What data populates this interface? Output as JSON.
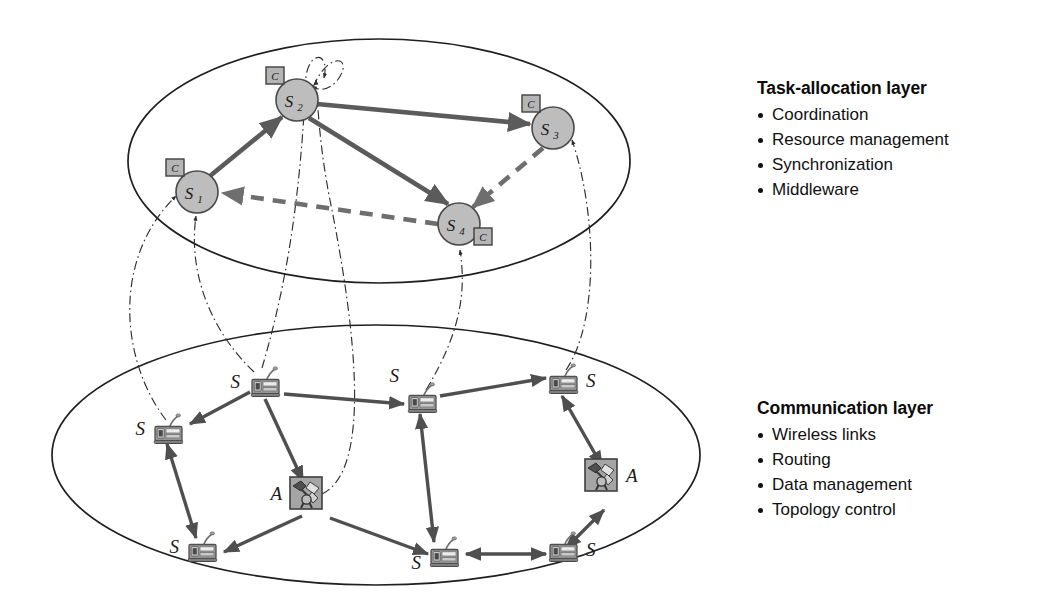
{
  "figure": {
    "kind": "layered-architecture-diagram",
    "background": "#ffffff"
  },
  "colors": {
    "node_fill": "#bdbdbd",
    "node_stroke": "#4a4a4a",
    "badge_fill": "#b5b5b5",
    "link_solid": "#5b5b5b",
    "link_dashed": "#6e6e6e",
    "cross_layer": "#2e2e2e",
    "ellipse_stroke": "#1f1f1f",
    "sensor_body": "#8c8c8c",
    "actuator_fill": "#9a9a9a",
    "text": "#111111"
  },
  "layers": {
    "task_allocation": {
      "panel_title": "Task-allocation layer",
      "bullets": [
        "Coordination",
        "Resource management",
        "Synchronization",
        "Middleware"
      ],
      "nodes": [
        {
          "id": "S1",
          "label": "S",
          "sub": "1",
          "badge": "C",
          "badge_pos": "top-left",
          "cx": 197,
          "cy": 192,
          "r": 21
        },
        {
          "id": "S2",
          "label": "S",
          "sub": "2",
          "badge": "C",
          "badge_pos": "top-left",
          "cx": 297,
          "cy": 100,
          "r": 21
        },
        {
          "id": "S3",
          "label": "S",
          "sub": "3",
          "badge": "C",
          "badge_pos": "top-left",
          "cx": 553,
          "cy": 128,
          "r": 21
        },
        {
          "id": "S4",
          "label": "S",
          "sub": "4",
          "badge": "C",
          "badge_pos": "bottom-right",
          "cx": 459,
          "cy": 224,
          "r": 21
        }
      ],
      "links": [
        {
          "from": "S1",
          "to": "S2",
          "style": "solid",
          "arrow": "end"
        },
        {
          "from": "S2",
          "to": "S3",
          "style": "solid",
          "arrow": "end"
        },
        {
          "from": "S2",
          "to": "S4",
          "style": "solid",
          "arrow": "end"
        },
        {
          "from": "S3",
          "to": "S4",
          "style": "dashed",
          "arrow": "end"
        },
        {
          "from": "S4",
          "to": "S1",
          "style": "dashed",
          "arrow": "end"
        },
        {
          "from": "S2",
          "to": "S2",
          "style": "selfloop-dashdot",
          "arrow": "end"
        }
      ]
    },
    "communication": {
      "panel_title": "Communication layer",
      "bullets": [
        "Wireless links",
        "Routing",
        "Data management",
        "Topology control"
      ],
      "nodes": [
        {
          "id": "n1",
          "type": "sensor",
          "label": "S",
          "label_side": "left",
          "x": 253,
          "y": 381
        },
        {
          "id": "n2",
          "type": "sensor",
          "label": "S",
          "label_side": "left",
          "x": 156,
          "y": 428
        },
        {
          "id": "n3",
          "type": "sensor",
          "label": "S",
          "label_side": "left",
          "x": 410,
          "y": 397
        },
        {
          "id": "n4",
          "type": "sensor",
          "label": "S",
          "label_side": "right",
          "x": 551,
          "y": 378
        },
        {
          "id": "n5",
          "type": "sensor",
          "label": "S",
          "label_side": "left",
          "x": 190,
          "y": 546
        },
        {
          "id": "n6",
          "type": "sensor",
          "label": "S",
          "label_side": "left",
          "x": 432,
          "y": 551
        },
        {
          "id": "n7",
          "type": "sensor",
          "label": "S",
          "label_side": "right",
          "x": 551,
          "y": 546
        },
        {
          "id": "a1",
          "type": "actuator",
          "label": "A",
          "label_side": "left",
          "x": 306,
          "y": 492
        },
        {
          "id": "a2",
          "type": "actuator",
          "label": "A",
          "label_side": "right",
          "x": 601,
          "y": 474
        }
      ],
      "links": [
        {
          "from": "n1",
          "to": "n2",
          "arrow": "end"
        },
        {
          "from": "n1",
          "to": "n3",
          "arrow": "end"
        },
        {
          "from": "n3",
          "to": "n4",
          "arrow": "end"
        },
        {
          "from": "n1",
          "to": "a1",
          "arrow": "end"
        },
        {
          "from": "n2",
          "to": "n5",
          "arrow": "both"
        },
        {
          "from": "n5",
          "to": "a1",
          "arrow": "end"
        },
        {
          "from": "a1",
          "to": "n6",
          "arrow": "end"
        },
        {
          "from": "n6",
          "to": "n3",
          "arrow": "end"
        },
        {
          "from": "n6",
          "to": "n7",
          "arrow": "both"
        },
        {
          "from": "n4",
          "to": "a2",
          "arrow": "both"
        },
        {
          "from": "a2",
          "to": "n7",
          "arrow": "both"
        }
      ]
    }
  },
  "cross_layer_links": [
    {
      "from": "n2",
      "to": "S1",
      "style": "dash-dot"
    },
    {
      "from": "n1",
      "to": "S1",
      "style": "dash-dot"
    },
    {
      "from": "n1",
      "to": "S2",
      "style": "dash-dot"
    },
    {
      "from": "a1",
      "to": "S2",
      "style": "dash-dot"
    },
    {
      "from": "n3",
      "to": "S4",
      "style": "dash-dot"
    },
    {
      "from": "n4",
      "to": "S3",
      "style": "dash-dot"
    }
  ],
  "legend_symbols": {
    "C": "coordinator badge",
    "S": "sensor node",
    "A": "actuator node"
  }
}
